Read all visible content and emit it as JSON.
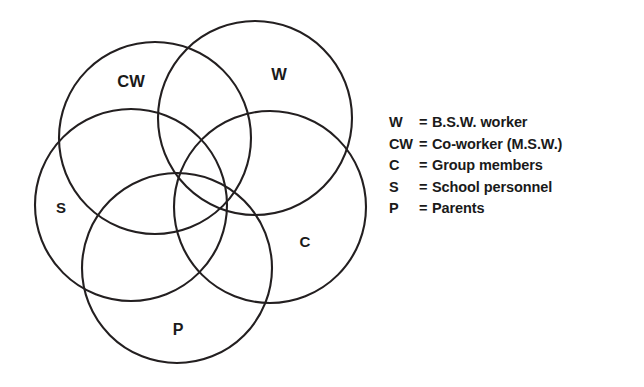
{
  "diagram": {
    "type": "venn",
    "title": "",
    "background_color": "#ffffff",
    "stroke_color": "#231f20",
    "circles": [
      {
        "id": "CW",
        "label": "CW",
        "cx": 155,
        "cy": 138,
        "r": 96,
        "label_x": 131,
        "label_y": 83
      },
      {
        "id": "W",
        "label": "W",
        "cx": 255,
        "cy": 118,
        "r": 97,
        "label_x": 279,
        "label_y": 76
      },
      {
        "id": "S",
        "label": "S",
        "cx": 131,
        "cy": 205,
        "r": 96,
        "label_x": 61,
        "label_y": 209
      },
      {
        "id": "C",
        "label": "C",
        "cx": 270,
        "cy": 207,
        "r": 96,
        "label_x": 305,
        "label_y": 243
      },
      {
        "id": "P",
        "label": "P",
        "cx": 177,
        "cy": 268,
        "r": 95,
        "label_x": 178,
        "label_y": 331
      }
    ]
  },
  "legend": {
    "equals": "=",
    "entries": [
      {
        "key": "W",
        "description": "B.S.W. worker"
      },
      {
        "key": "CW",
        "description": "Co-worker (M.S.W.)"
      },
      {
        "key": "C",
        "description": "Group members"
      },
      {
        "key": "S",
        "description": "School personnel"
      },
      {
        "key": "P",
        "description": "Parents"
      }
    ]
  }
}
